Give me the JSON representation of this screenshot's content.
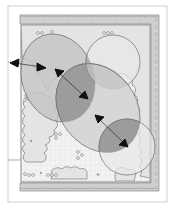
{
  "diagram": {
    "colors": {
      "background": "#ffffff",
      "page_border": "#b8b8b8",
      "hedge_band": "#cfcfcf",
      "hedge_edge": "#8a8a8a",
      "plot_fill": "#eeeeee",
      "grid": "#dadada",
      "shrub_fill": "#e6e6e6",
      "shrub_edge": "#6a6a6a",
      "zone_fill": "#c4c4c4",
      "zone_edge": "#6f6f6f",
      "overlap_fill": "#9c9c9c",
      "arrow": "#111111"
    },
    "zones": [
      {
        "name": "zone-upper-left",
        "shape": "ellipse"
      },
      {
        "name": "zone-upper-right",
        "shape": "circle"
      },
      {
        "name": "zone-center",
        "shape": "ellipse"
      },
      {
        "name": "zone-lower-right",
        "shape": "circle"
      }
    ],
    "arrows": [
      {
        "name": "arrow-west",
        "direction": "left"
      },
      {
        "name": "arrow-east",
        "direction": "right"
      },
      {
        "name": "arrow-center-nw",
        "direction": "up-left"
      },
      {
        "name": "arrow-center-se",
        "direction": "down-right"
      },
      {
        "name": "arrow-lower-nw",
        "direction": "up-left"
      },
      {
        "name": "arrow-lower-se",
        "direction": "down-right"
      }
    ]
  }
}
